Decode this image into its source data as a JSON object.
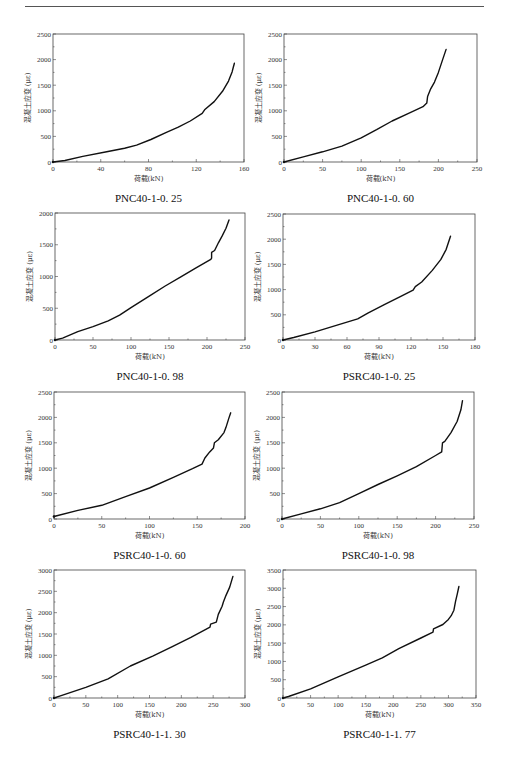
{
  "page": {
    "header_rule": true
  },
  "chart_data": [
    {
      "type": "line",
      "caption": "PNC40-1-0. 25",
      "xlabel": "荷载(kN)",
      "ylabel": "混凝土应变 (με)",
      "xlim": [
        0,
        160
      ],
      "ylim": [
        0,
        2500
      ],
      "xticks": [
        0,
        40,
        80,
        120,
        160
      ],
      "yticks": [
        0,
        500,
        1000,
        1500,
        2000,
        2500
      ],
      "series": [
        {
          "name": "PNC40-1-0.25",
          "x": [
            0,
            10,
            25,
            45,
            60,
            70,
            82,
            95,
            105,
            115,
            125,
            127,
            135,
            142,
            147,
            150,
            151,
            152
          ],
          "y": [
            0,
            30,
            110,
            200,
            270,
            330,
            440,
            580,
            680,
            800,
            950,
            1020,
            1180,
            1380,
            1580,
            1760,
            1850,
            1930
          ]
        }
      ]
    },
    {
      "type": "line",
      "caption": "PNC40-1-0. 60",
      "xlabel": "荷载(kN)",
      "ylabel": "混凝土应变 (με)",
      "xlim": [
        0,
        250
      ],
      "ylim": [
        0,
        2500
      ],
      "xticks": [
        0,
        50,
        100,
        150,
        200,
        250
      ],
      "yticks": [
        0,
        500,
        1000,
        1500,
        2000,
        2500
      ],
      "series": [
        {
          "name": "PNC40-1-0.60",
          "x": [
            0,
            25,
            50,
            75,
            100,
            120,
            140,
            160,
            180,
            185,
            186,
            190,
            195,
            200,
            205,
            210
          ],
          "y": [
            0,
            100,
            200,
            310,
            470,
            630,
            800,
            940,
            1080,
            1150,
            1280,
            1430,
            1560,
            1750,
            1980,
            2200
          ]
        }
      ]
    },
    {
      "type": "line",
      "caption": "PNC40-1-0. 98",
      "xlabel": "荷载(kN)",
      "ylabel": "混凝土应变 (με)",
      "xlim": [
        0,
        250
      ],
      "ylim": [
        0,
        2000
      ],
      "xticks": [
        0,
        50,
        100,
        150,
        200,
        250
      ],
      "yticks": [
        0,
        500,
        1000,
        1500,
        2000
      ],
      "series": [
        {
          "name": "PNC40-1-0.98",
          "x": [
            0,
            10,
            30,
            50,
            70,
            85,
            100,
            125,
            145,
            165,
            185,
            205,
            206,
            206,
            210,
            215,
            220,
            225,
            229
          ],
          "y": [
            0,
            30,
            130,
            210,
            300,
            390,
            510,
            700,
            850,
            990,
            1130,
            1270,
            1290,
            1380,
            1410,
            1530,
            1640,
            1760,
            1890
          ]
        }
      ]
    },
    {
      "type": "line",
      "caption": "PSRC40-1-0. 25",
      "xlabel": "荷载(kN)",
      "ylabel": "混凝土应变 (με)",
      "xlim": [
        0,
        180
      ],
      "ylim": [
        0,
        2500
      ],
      "xticks": [
        0,
        30,
        60,
        90,
        120,
        150,
        180
      ],
      "yticks": [
        0,
        500,
        1000,
        1500,
        2000,
        2500
      ],
      "series": [
        {
          "name": "PSRC40-1-0.25",
          "x": [
            0,
            10,
            30,
            50,
            70,
            80,
            95,
            110,
            122,
            124,
            130,
            140,
            148,
            153,
            157
          ],
          "y": [
            0,
            50,
            160,
            290,
            420,
            540,
            700,
            860,
            990,
            1060,
            1150,
            1380,
            1600,
            1800,
            2060
          ]
        }
      ]
    },
    {
      "type": "line",
      "caption": "PSRC40-1-0. 60",
      "xlabel": "荷载(kN)",
      "ylabel": "混凝土应变 (με)",
      "xlim": [
        0,
        200
      ],
      "ylim": [
        0,
        2500
      ],
      "xticks": [
        0,
        50,
        100,
        150,
        200
      ],
      "yticks": [
        0,
        500,
        1000,
        1500,
        2000,
        2500
      ],
      "series": [
        {
          "name": "PSRC40-1-0.60",
          "x": [
            0,
            2,
            25,
            50,
            75,
            100,
            125,
            145,
            155,
            158,
            163,
            167,
            168,
            172,
            178,
            180,
            183,
            185
          ],
          "y": [
            50,
            60,
            170,
            270,
            440,
            610,
            820,
            990,
            1080,
            1200,
            1320,
            1400,
            1500,
            1560,
            1700,
            1800,
            1980,
            2090
          ]
        }
      ]
    },
    {
      "type": "line",
      "caption": "PSRC40-1-0. 98",
      "xlabel": "荷载(kN)",
      "ylabel": "混凝土应变 (με)",
      "xlim": [
        0,
        250
      ],
      "ylim": [
        0,
        2500
      ],
      "xticks": [
        0,
        50,
        100,
        150,
        200,
        250
      ],
      "yticks": [
        0,
        500,
        1000,
        1500,
        2000,
        2500
      ],
      "series": [
        {
          "name": "PSRC40-1-0.98",
          "x": [
            0,
            25,
            50,
            75,
            100,
            125,
            150,
            175,
            200,
            208,
            209,
            212,
            220,
            228,
            233,
            235
          ],
          "y": [
            0,
            100,
            200,
            320,
            500,
            680,
            850,
            1030,
            1250,
            1320,
            1500,
            1530,
            1700,
            1920,
            2150,
            2330
          ]
        }
      ]
    },
    {
      "type": "line",
      "caption": "PSRC40-1-1. 30",
      "xlabel": "荷载(kN)",
      "ylabel": "混凝土应变 (με)",
      "xlim": [
        0,
        300
      ],
      "ylim": [
        0,
        3000
      ],
      "xticks": [
        0,
        50,
        100,
        150,
        200,
        250,
        300
      ],
      "yticks": [
        0,
        500,
        1000,
        1500,
        2000,
        2500,
        3000
      ],
      "series": [
        {
          "name": "PSRC40-1-1.30",
          "x": [
            0,
            10,
            50,
            85,
            120,
            155,
            185,
            215,
            245,
            246,
            255,
            258,
            264,
            266,
            270,
            276,
            281
          ],
          "y": [
            0,
            50,
            250,
            450,
            750,
            980,
            1200,
            1420,
            1660,
            1730,
            1780,
            1960,
            2150,
            2250,
            2400,
            2600,
            2850
          ]
        }
      ]
    },
    {
      "type": "line",
      "caption": "PSRC40-1-1. 77",
      "xlabel": "荷载(kN)",
      "ylabel": "混凝土应变 (με)",
      "xlim": [
        0,
        350
      ],
      "ylim": [
        0,
        3500
      ],
      "xticks": [
        0,
        50,
        100,
        150,
        200,
        250,
        300,
        350
      ],
      "yticks": [
        0,
        500,
        1000,
        1500,
        2000,
        2500,
        3000,
        3500
      ],
      "series": [
        {
          "name": "PSRC40-1-1.77",
          "x": [
            0,
            10,
            50,
            100,
            150,
            180,
            210,
            250,
            272,
            273,
            290,
            300,
            305,
            310,
            313,
            316,
            319
          ],
          "y": [
            0,
            40,
            250,
            580,
            900,
            1100,
            1350,
            1640,
            1800,
            1890,
            2010,
            2150,
            2250,
            2400,
            2650,
            2850,
            3050
          ]
        }
      ]
    }
  ]
}
